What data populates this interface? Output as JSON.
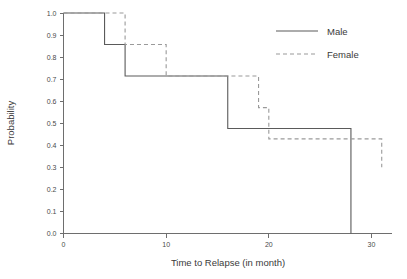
{
  "chart_data": {
    "type": "line",
    "title": "",
    "xlabel": "Time to Relapse (in month)",
    "ylabel": "Probability",
    "xlim": [
      0,
      32
    ],
    "ylim": [
      0,
      1.0
    ],
    "grid": false,
    "legend_position": "top-right",
    "xticks": [
      0,
      10,
      20,
      30
    ],
    "xtick_labels": [
      "0",
      "10",
      "20",
      "30"
    ],
    "yticks": [
      0.0,
      0.1,
      0.2,
      0.3,
      0.4,
      0.5,
      0.6,
      0.7,
      0.8,
      0.9,
      1.0
    ],
    "ytick_labels": [
      "0.0",
      "0.1",
      "0.2",
      "0.3",
      "0.4",
      "0.5",
      "0.6",
      "0.7",
      "0.8",
      "0.9",
      "1.0"
    ],
    "series": [
      {
        "name": "Male",
        "style": "solid",
        "color": "#5a5a5a",
        "steps": [
          {
            "x": 0,
            "y": 1.0
          },
          {
            "x": 4,
            "y": 1.0
          },
          {
            "x": 4,
            "y": 0.857
          },
          {
            "x": 6,
            "y": 0.857
          },
          {
            "x": 6,
            "y": 0.714
          },
          {
            "x": 16,
            "y": 0.714
          },
          {
            "x": 16,
            "y": 0.476
          },
          {
            "x": 28,
            "y": 0.476
          },
          {
            "x": 28,
            "y": 0.0
          }
        ]
      },
      {
        "name": "Female",
        "style": "dashed",
        "color": "#9a9a9a",
        "steps": [
          {
            "x": 0,
            "y": 1.0
          },
          {
            "x": 6,
            "y": 1.0
          },
          {
            "x": 6,
            "y": 0.857
          },
          {
            "x": 10,
            "y": 0.857
          },
          {
            "x": 10,
            "y": 0.714
          },
          {
            "x": 19,
            "y": 0.714
          },
          {
            "x": 19,
            "y": 0.571
          },
          {
            "x": 20,
            "y": 0.571
          },
          {
            "x": 20,
            "y": 0.429
          },
          {
            "x": 31,
            "y": 0.429
          },
          {
            "x": 31,
            "y": 0.3
          }
        ]
      }
    ]
  },
  "legend": {
    "entries": [
      {
        "label": "Male"
      },
      {
        "label": "Female"
      }
    ]
  }
}
